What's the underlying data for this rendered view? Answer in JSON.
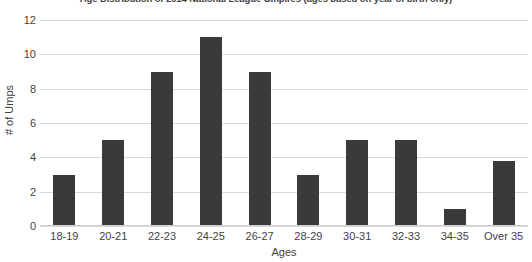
{
  "chart_data": {
    "type": "bar",
    "title": "Age Distribution of 2014 National League Umpires (ages based on year of birth only)",
    "xlabel": "Ages",
    "ylabel": "# of Umps",
    "categories": [
      "18-19",
      "20-21",
      "22-23",
      "24-25",
      "26-27",
      "28-29",
      "30-31",
      "32-33",
      "34-35",
      "Over 35"
    ],
    "values": [
      3,
      5,
      9,
      11,
      9,
      3,
      5,
      5,
      1,
      3.8
    ],
    "ylim": [
      0,
      12
    ],
    "yticks": [
      0,
      2,
      4,
      6,
      8,
      10,
      12
    ],
    "ytick_labels": [
      "0",
      "2",
      "4",
      "6",
      "8",
      "10",
      "12"
    ],
    "grid": true,
    "legend": false,
    "bar_color": "#3a3a3a",
    "gridline_color": "#d9d9d9"
  }
}
